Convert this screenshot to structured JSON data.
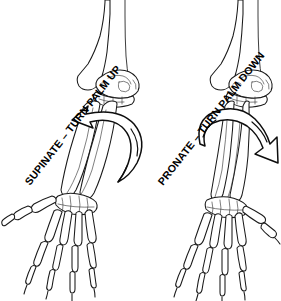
{
  "figure": {
    "background_color": "#ffffff",
    "line_color": "#1a1a1a",
    "width": 281,
    "height": 301
  },
  "panels": [
    {
      "id": "supination",
      "side": "left",
      "label": "SUPINATE – TURN PALM UP",
      "label_rotation_deg": -52,
      "arrow": {
        "name": "rotation-arrow-counterclockwise",
        "direction": "counterclockwise",
        "head_points": "left"
      },
      "parts": [
        "humerus",
        "elbow-joint",
        "radius",
        "ulna",
        "carpals",
        "metacarpals",
        "phalanges"
      ]
    },
    {
      "id": "pronation",
      "side": "right",
      "label": "PRONATE – TURN PALM DOWN",
      "label_rotation_deg": -52,
      "arrow": {
        "name": "rotation-arrow-clockwise",
        "direction": "clockwise",
        "head_points": "right"
      },
      "parts": [
        "humerus",
        "elbow-joint",
        "radius",
        "ulna",
        "carpals",
        "metacarpals",
        "phalanges"
      ]
    }
  ]
}
